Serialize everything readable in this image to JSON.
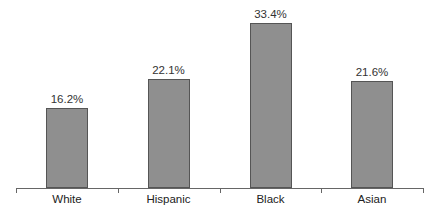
{
  "chart_data": {
    "type": "bar",
    "title": "",
    "xlabel": "",
    "ylabel": "",
    "categories": [
      "White",
      "Hispanic",
      "Black",
      "Asian"
    ],
    "values": [
      16.2,
      22.1,
      33.4,
      21.6
    ],
    "value_labels": [
      "16.2%",
      "22.1%",
      "33.4%",
      "21.6%"
    ],
    "unit": "%",
    "ylim": [
      0,
      36
    ],
    "grid": false,
    "legend": null,
    "bar_color": "#8f8f8f"
  }
}
